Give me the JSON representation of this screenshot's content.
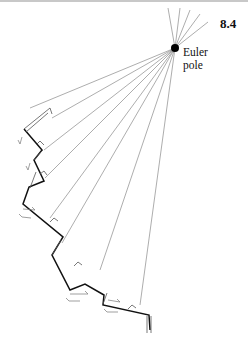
{
  "figure": {
    "number": "8.4",
    "pole_label_line1": "Euler",
    "pole_label_line2": "pole",
    "pole": {
      "x": 175,
      "y": 48
    },
    "colors": {
      "boundary": "#111111",
      "rays": "#8a8a8a",
      "pole": "#000000"
    }
  }
}
